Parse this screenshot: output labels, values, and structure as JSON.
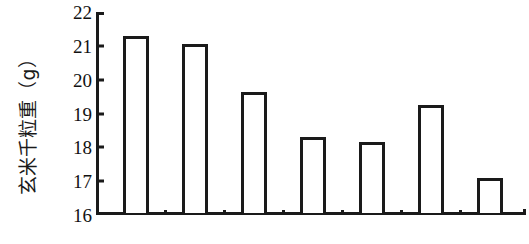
{
  "chart_data": {
    "type": "bar",
    "title": "",
    "xlabel": "",
    "ylabel": "玄米千粒重（g）",
    "ylim": [
      16,
      22
    ],
    "ytick_labels": [
      "22",
      "21",
      "20",
      "19",
      "18",
      "17",
      "16"
    ],
    "ytick_values": [
      22,
      21,
      20,
      19,
      18,
      17,
      16
    ],
    "grid": false,
    "legend": null,
    "categories": [
      "1",
      "2",
      "3",
      "4",
      "5",
      "6",
      "7"
    ],
    "values": [
      21.15,
      20.9,
      19.5,
      18.15,
      18.0,
      19.1,
      16.95
    ],
    "bar_fill_color": "#ffffff",
    "bar_edge_color": "#1a1a1a",
    "axis_color": "#1a1a1a",
    "background_color": "#ffffff"
  }
}
